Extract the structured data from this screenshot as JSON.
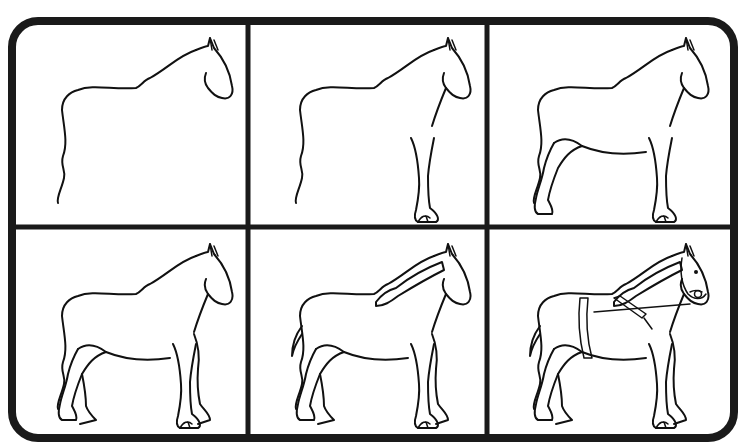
{
  "colors": {
    "background": "#ffffff",
    "frame": "#1a1a1a",
    "line": "#111111"
  },
  "grid": {
    "rows": 2,
    "columns": 3
  },
  "panels": [
    {
      "step": 1,
      "description": "Back, neck and head outline with front edge of hind leg"
    },
    {
      "step": 2,
      "description": "Adds chest line and front leg with hoof"
    },
    {
      "step": 3,
      "description": "Adds belly, hind leg and hoof"
    },
    {
      "step": 4,
      "description": "Adds far legs and feathering"
    },
    {
      "step": 5,
      "description": "Adds mane and tail"
    },
    {
      "step": 6,
      "description": "Adds bridle, eye and harness collar straps"
    }
  ]
}
